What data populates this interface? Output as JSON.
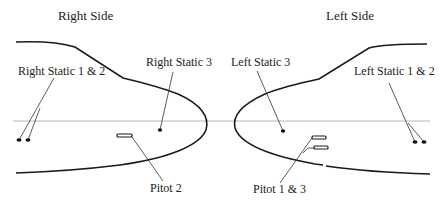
{
  "titles": {
    "right": "Right Side",
    "left": "Left Side"
  },
  "labels": {
    "right_static_1_2": "Right Static 1 & 2",
    "right_static_3": "Right Static 3",
    "pitot_2": "Pitot 2",
    "left_static_3": "Left Static 3",
    "left_static_1_2": "Left Static 1 & 2",
    "pitot_1_3": "Pitot 1 & 3"
  },
  "colors": {
    "outline": "#1a1a1a",
    "reference_line": "#b8b8b8",
    "background": "#ffffff"
  }
}
